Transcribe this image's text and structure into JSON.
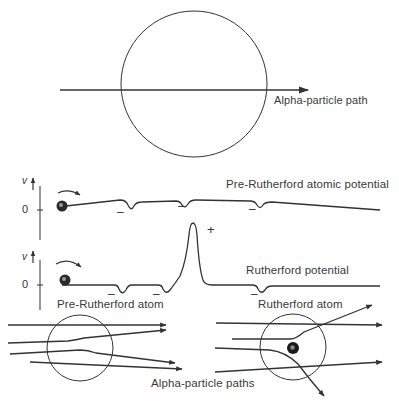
{
  "top_panel": {
    "path_label": "Alpha-particle path"
  },
  "potential_panels": [
    {
      "title": "Pre-Rutherford atomic potential",
      "y_axis_label": "v",
      "zero_label": "0",
      "minus_signs": [
        "–",
        "–",
        "–"
      ]
    },
    {
      "title": "Rutherford potential",
      "y_axis_label": "v",
      "zero_label": "0",
      "plus_sign": "+",
      "minus_signs": [
        "–",
        "–",
        "–"
      ]
    }
  ],
  "atom_models": {
    "left_label": "Pre-Rutherford atom",
    "right_label": "Rutherford atom",
    "paths_label": "Alpha-particle paths"
  },
  "colors": {
    "line": "#333333",
    "nucleus": "#1a1a1a",
    "background": "#ffffff"
  }
}
